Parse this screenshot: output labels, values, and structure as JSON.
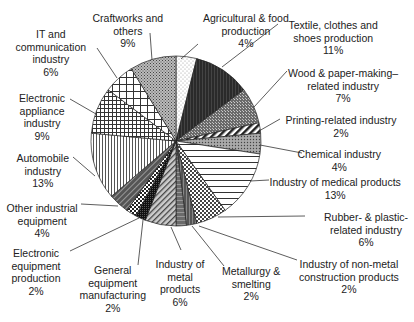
{
  "chart_data": {
    "type": "pie",
    "title": "",
    "start_angle_deg": 0,
    "direction": "clockwise",
    "unit": "%",
    "slices": [
      {
        "label": "Agricultural & food production",
        "value": 4
      },
      {
        "label": "Textile, clothes and shoes production",
        "value": 11
      },
      {
        "label": "Wood & paper-making–related industry",
        "value": 7
      },
      {
        "label": "Printing-related industry",
        "value": 2
      },
      {
        "label": "Chemical industry",
        "value": 4
      },
      {
        "label": "Industry of medical products",
        "value": 13
      },
      {
        "label": "Rubber- & plastic-related industry",
        "value": 6
      },
      {
        "label": "Industry of non-metal construction products",
        "value": 2
      },
      {
        "label": "Metallurgy & smelting",
        "value": 2
      },
      {
        "label": "Industry of metal products",
        "value": 6
      },
      {
        "label": "General equipment manufacturing",
        "value": 2
      },
      {
        "label": "Electronic equipment production",
        "value": 2
      },
      {
        "label": "Other industrial equipment",
        "value": 4
      },
      {
        "label": "Automobile industry",
        "value": 13
      },
      {
        "label": "Electronic appliance industry",
        "value": 9
      },
      {
        "label": "IT and communication industry",
        "value": 6
      },
      {
        "label": "Craftworks and others",
        "value": 9
      }
    ],
    "legend": "none (leader-line labels)"
  },
  "labels": [
    {
      "lines": [
        "Agricultural & food",
        "production",
        "4%"
      ],
      "x": 246,
      "y": 12,
      "ax": 181,
      "ay": 59,
      "lx": 198,
      "ly": 44
    },
    {
      "lines": [
        "Textile, clothes and",
        "shoes production",
        "11%"
      ],
      "x": 333,
      "y": 19,
      "ax": 222,
      "ay": 67,
      "lx": 278,
      "ly": 24
    },
    {
      "lines": [
        "Wood & paper-making–",
        "related industry",
        "7%"
      ],
      "x": 343,
      "y": 67,
      "ax": 254,
      "ay": 107,
      "lx": 287,
      "ly": 71
    },
    {
      "lines": [
        "Printing-related industry",
        "2%"
      ],
      "x": 341,
      "y": 114,
      "ax": 259,
      "ay": 131,
      "lx": 280,
      "ly": 119
    },
    {
      "lines": [
        "Chemical industry",
        "4%"
      ],
      "x": 339,
      "y": 148,
      "ax": 260,
      "ay": 145,
      "lx": 302,
      "ly": 153
    },
    {
      "lines": [
        "Industry of medical products",
        "13%"
      ],
      "x": 335,
      "y": 176,
      "ax": 250,
      "ay": 181,
      "lx": 269,
      "ly": 180
    },
    {
      "lines": [
        "Rubber- & plastic-",
        "related industry",
        "6%"
      ],
      "x": 366,
      "y": 211,
      "ax": 218,
      "ay": 217,
      "lx": 305,
      "ly": 216
    },
    {
      "lines": [
        "Industry of non-metal",
        "construction products",
        "2%"
      ],
      "x": 349,
      "y": 258,
      "ax": 199,
      "ay": 226,
      "lx": 297,
      "ly": 260
    },
    {
      "lines": [
        "Metallurgy &",
        "smelting",
        "2%"
      ],
      "x": 251,
      "y": 265,
      "ax": 192,
      "ay": 226,
      "lx": 224,
      "ly": 266
    },
    {
      "lines": [
        "Industry of",
        "metal",
        "products",
        "6%"
      ],
      "x": 180,
      "y": 258,
      "ax": 171,
      "ay": 227,
      "lx": 181,
      "ly": 250
    },
    {
      "lines": [
        "General",
        "equipment",
        "manufacturing",
        "2%"
      ],
      "x": 113,
      "y": 264,
      "ax": 143,
      "ay": 220,
      "lx": 138,
      "ly": 265
    },
    {
      "lines": [
        "Electronic",
        "equipment",
        "production",
        "2%"
      ],
      "x": 36,
      "y": 247,
      "ax": 139,
      "ay": 218,
      "lx": 70,
      "ly": 251
    },
    {
      "lines": [
        "Other industrial",
        "equipment",
        "4%"
      ],
      "x": 42,
      "y": 202,
      "ax": 118,
      "ay": 206,
      "lx": 81,
      "ly": 204
    },
    {
      "lines": [
        "Automobile",
        "industry",
        "13%"
      ],
      "x": 43,
      "y": 152,
      "ax": 95,
      "ay": 176,
      "lx": 73,
      "ly": 157
    },
    {
      "lines": [
        "Electronic",
        "appliance",
        "industry",
        "9%"
      ],
      "x": 42,
      "y": 92,
      "ax": 96,
      "ay": 114,
      "lx": 70,
      "ly": 99
    },
    {
      "lines": [
        "IT and",
        "communication",
        "industry",
        "6%"
      ],
      "x": 51,
      "y": 28,
      "ax": 117,
      "ay": 78,
      "lx": 97,
      "ly": 48
    },
    {
      "lines": [
        "Craftworks and",
        "others",
        "9%"
      ],
      "x": 128,
      "y": 12,
      "ax": 152,
      "ay": 60,
      "lx": 150,
      "ly": 33
    }
  ]
}
